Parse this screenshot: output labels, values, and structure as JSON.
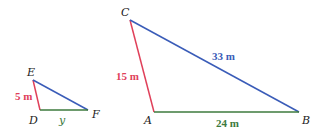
{
  "colors": {
    "red": "#e0405a",
    "blue": "#3a5cb8",
    "green": "#3d7a3d",
    "vertex": "#222222"
  },
  "small_triangle": {
    "vertices": {
      "E": "E",
      "D": "D",
      "F": "F"
    },
    "sides": {
      "ED": "5 m",
      "DF": "y"
    }
  },
  "large_triangle": {
    "vertices": {
      "C": "C",
      "A": "A",
      "B": "B"
    },
    "sides": {
      "CA": "15 m",
      "CB": "33 m",
      "AB": "24 m"
    }
  }
}
